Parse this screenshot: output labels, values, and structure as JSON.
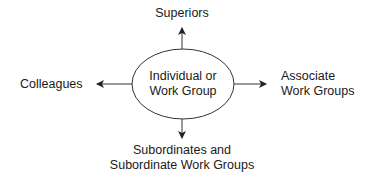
{
  "diagram": {
    "center": {
      "line1": "Individual or",
      "line2": "Work Group"
    },
    "top": {
      "line1": "Superiors"
    },
    "left": {
      "line1": "Colleagues"
    },
    "right": {
      "line1": "Associate",
      "line2": "Work Groups"
    },
    "bottom": {
      "line1": "Subordinates and",
      "line2": "Subordinate Work Groups"
    },
    "colors": {
      "stroke": "#333333",
      "text": "#1a1a1a",
      "background": "#ffffff"
    }
  }
}
